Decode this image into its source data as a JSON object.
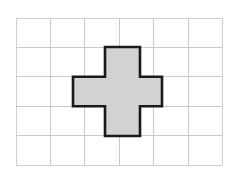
{
  "figure": {
    "title": "Plus-shaped polygon on a square grid",
    "background_color": "#ffffff"
  },
  "grid": {
    "name": "square-grid",
    "columns": 6,
    "rows": 5,
    "cell_width": 34.4,
    "cell_height": 29.4,
    "origin_x": 16,
    "origin_y": 18,
    "line_color": "#c9c9c9",
    "outer_line_color": "#cfcfcf",
    "line_width": 1,
    "vertical_line_x": [
      16,
      50.4,
      84.8,
      119.2,
      153.6,
      188,
      222.4
    ],
    "horizontal_line_y": [
      18,
      47.4,
      76.8,
      106.2,
      135.6,
      165
    ]
  },
  "cross": {
    "name": "plus-polygon",
    "fill_color": "#d2d2d2",
    "stroke_color": "#1a1a1a",
    "stroke_width": 2.6,
    "bounds": {
      "left": 73,
      "top": 47,
      "right": 162,
      "bottom": 136
    },
    "arm_left": 73,
    "arm_right": 162,
    "arm_top": 47,
    "arm_bottom": 136,
    "stem_left": 105,
    "stem_right": 140,
    "bar_top": 76.8,
    "bar_bottom": 106.2,
    "points": "105,47 140,47 140,76.8 162,76.8 162,106.2 140,106.2 140,136 105,136 105,106.2 73,106.2 73,76.8 105,76.8",
    "vertex_count": 12
  },
  "chart_data": {
    "type": "diagram",
    "title": "Plus-shaped polygon on a square grid",
    "grid_units": {
      "width": 6,
      "height": 5
    },
    "shape": "plus",
    "shape_area_units": 5,
    "shape_perimeter_units": 12
  }
}
